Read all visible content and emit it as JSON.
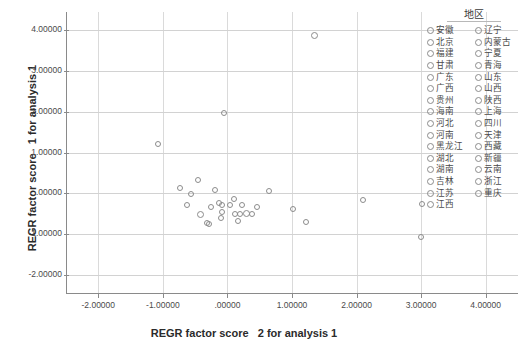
{
  "chart_data": {
    "type": "scatter",
    "title": "",
    "xlabel": "REGR factor score   2 for analysis 1",
    "ylabel": "REGR factor score   1 for analysis 1",
    "xlim": [
      -2.5,
      4.5
    ],
    "ylim": [
      -2.4,
      4.4
    ],
    "xticks": [
      "-2.00000",
      "-1.00000",
      ".00000",
      "1.00000",
      "2.00000",
      "3.00000",
      "4.00000"
    ],
    "xtick_values": [
      -2,
      -1,
      0,
      1,
      2,
      3,
      4
    ],
    "yticks": [
      "4.00000",
      "3.00000",
      "2.00000",
      "1.00000",
      ".00000",
      "-1.00000",
      "-2.00000"
    ],
    "ytick_values": [
      4,
      3,
      2,
      1,
      0,
      -1,
      -2
    ],
    "grid": true,
    "legend_position": "right",
    "marker": "open-circle",
    "points": [
      {
        "label": "安徽",
        "x": -0.08,
        "y": -0.47,
        "size": 6
      },
      {
        "label": "北京",
        "x": 1.35,
        "y": 3.87,
        "size": 7
      },
      {
        "label": "福建",
        "x": 0.46,
        "y": -0.34,
        "size": 6
      },
      {
        "label": "甘肃",
        "x": -0.62,
        "y": -0.3,
        "size": 6
      },
      {
        "label": "广东",
        "x": 2.1,
        "y": -0.16,
        "size": 6
      },
      {
        "label": "广西",
        "x": -0.31,
        "y": -0.72,
        "size": 6
      },
      {
        "label": "贵州",
        "x": -0.28,
        "y": -0.76,
        "size": 6
      },
      {
        "label": "海南",
        "x": -0.56,
        "y": -0.02,
        "size": 6
      },
      {
        "label": "河北",
        "x": 0.12,
        "y": -0.52,
        "size": 6
      },
      {
        "label": "河南",
        "x": 0.2,
        "y": -0.52,
        "size": 6
      },
      {
        "label": "黑龙江",
        "x": -0.08,
        "y": -0.3,
        "size": 6
      },
      {
        "label": "湖北",
        "x": 0.04,
        "y": -0.28,
        "size": 6
      },
      {
        "label": "湖南",
        "x": 0.22,
        "y": -0.3,
        "size": 6
      },
      {
        "label": "吉林",
        "x": -0.41,
        "y": -0.52,
        "size": 7
      },
      {
        "label": "江苏",
        "x": 0.38,
        "y": -0.5,
        "size": 6
      },
      {
        "label": "江西",
        "x": -0.13,
        "y": -0.25,
        "size": 6
      },
      {
        "label": "辽宁",
        "x": 0.3,
        "y": -0.5,
        "size": 7
      },
      {
        "label": "内蒙古",
        "x": -1.07,
        "y": 1.22,
        "size": 6
      },
      {
        "label": "宁夏",
        "x": -0.74,
        "y": 0.12,
        "size": 6
      },
      {
        "label": "青海",
        "x": -0.46,
        "y": 0.32,
        "size": 6
      },
      {
        "label": "山东",
        "x": 1.02,
        "y": -0.38,
        "size": 6
      },
      {
        "label": "山西",
        "x": -0.19,
        "y": 0.08,
        "size": 6
      },
      {
        "label": "陕西",
        "x": 0.1,
        "y": -0.14,
        "size": 6
      },
      {
        "label": "上海",
        "x": -0.05,
        "y": 1.98,
        "size": 6
      },
      {
        "label": "四川",
        "x": 0.64,
        "y": 0.06,
        "size": 6
      },
      {
        "label": "天津",
        "x": 3.02,
        "y": -0.26,
        "size": 6
      },
      {
        "label": "西藏",
        "x": 3.0,
        "y": -1.08,
        "size": 6
      },
      {
        "label": "新疆",
        "x": -0.26,
        "y": -0.33,
        "size": 6
      },
      {
        "label": "云南",
        "x": 0.16,
        "y": -0.68,
        "size": 6
      },
      {
        "label": "浙江",
        "x": 1.22,
        "y": -0.7,
        "size": 6
      },
      {
        "label": "重庆",
        "x": -0.1,
        "y": -0.62,
        "size": 6
      }
    ]
  },
  "legend": {
    "title": "地区",
    "columns": [
      {
        "items": [
          {
            "label": "安徽"
          },
          {
            "label": "北京"
          },
          {
            "label": "福建"
          },
          {
            "label": "甘肃"
          },
          {
            "label": "广东"
          },
          {
            "label": "广西"
          },
          {
            "label": "贵州"
          },
          {
            "label": "海南"
          },
          {
            "label": "河北"
          },
          {
            "label": "河南"
          },
          {
            "label": "黑龙江"
          },
          {
            "label": "湖北"
          },
          {
            "label": "湖南"
          },
          {
            "label": "吉林"
          },
          {
            "label": "江苏"
          },
          {
            "label": "江西"
          }
        ]
      },
      {
        "items": [
          {
            "label": "辽宁"
          },
          {
            "label": "内蒙古"
          },
          {
            "label": "宁夏"
          },
          {
            "label": "青海"
          },
          {
            "label": "山东"
          },
          {
            "label": "山西"
          },
          {
            "label": "陕西"
          },
          {
            "label": "上海"
          },
          {
            "label": "四川"
          },
          {
            "label": "天津"
          },
          {
            "label": "西藏"
          },
          {
            "label": "新疆"
          },
          {
            "label": "云南"
          },
          {
            "label": "浙江"
          },
          {
            "label": "重庆"
          }
        ]
      }
    ]
  },
  "colors": {
    "marker_stroke": "#8c8c8c",
    "axis": "#8a8a8a",
    "gridline": "#d6d6d6",
    "text": "#4a4a4a",
    "title_text": "#2b2b2b",
    "background": "#ffffff"
  }
}
